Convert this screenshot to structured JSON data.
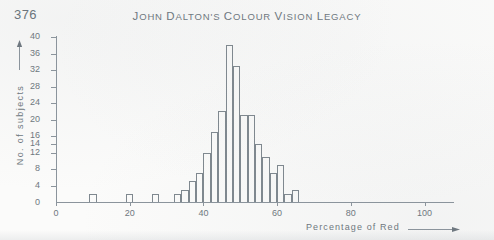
{
  "page": {
    "number": "376",
    "running_head": "John Dalton's Colour Vision Legacy"
  },
  "chart_data": {
    "type": "bar",
    "title": "",
    "xlabel": "Percentage of Red",
    "ylabel": "No. of subjects",
    "xlim": [
      0,
      108
    ],
    "ylim": [
      0,
      40
    ],
    "grid": false,
    "legend": null,
    "bin_width": 2,
    "x_ticks": [
      0,
      20,
      40,
      60,
      80,
      100
    ],
    "x_tick_labels": [
      "0",
      "20",
      "40",
      "60",
      "80",
      "100"
    ],
    "y_ticks": [
      4,
      8,
      12,
      14,
      16,
      20,
      24,
      28,
      32,
      36,
      40
    ],
    "y_tick_labels": [
      "4",
      "8",
      "12",
      "14",
      "16",
      "20",
      "24",
      "28",
      "32",
      "36",
      "40"
    ],
    "y_axis_zero_label": "0",
    "categories": [
      10,
      12,
      20,
      22,
      27,
      29,
      33,
      35,
      37,
      39,
      41,
      43,
      45,
      47,
      49,
      51,
      53,
      55,
      57,
      59,
      61,
      63,
      65
    ],
    "values": [
      2,
      0,
      2,
      0,
      2,
      0,
      2,
      3,
      5,
      7,
      12,
      17,
      22,
      38,
      33,
      21,
      21,
      14,
      11,
      7,
      9,
      2,
      3
    ],
    "bars": [
      {
        "x": 10,
        "height": 2
      },
      {
        "x": 20,
        "height": 2
      },
      {
        "x": 27,
        "height": 2
      },
      {
        "x": 33,
        "height": 2
      },
      {
        "x": 35,
        "height": 3
      },
      {
        "x": 37,
        "height": 5
      },
      {
        "x": 39,
        "height": 7
      },
      {
        "x": 41,
        "height": 12
      },
      {
        "x": 43,
        "height": 17
      },
      {
        "x": 45,
        "height": 22
      },
      {
        "x": 47,
        "height": 38
      },
      {
        "x": 49,
        "height": 33
      },
      {
        "x": 51,
        "height": 21
      },
      {
        "x": 53,
        "height": 21
      },
      {
        "x": 55,
        "height": 14
      },
      {
        "x": 57,
        "height": 11
      },
      {
        "x": 59,
        "height": 7
      },
      {
        "x": 61,
        "height": 9
      },
      {
        "x": 63,
        "height": 2
      },
      {
        "x": 65,
        "height": 3
      }
    ],
    "peak": {
      "x": 47,
      "value": 38
    }
  }
}
